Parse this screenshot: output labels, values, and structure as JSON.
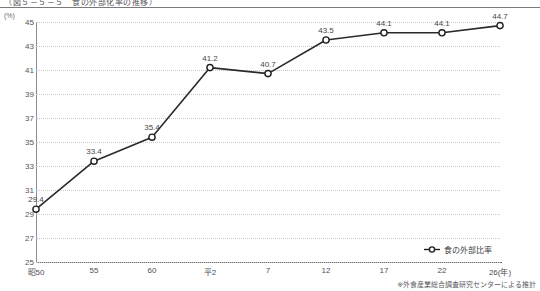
{
  "figure": {
    "title": "（図５－５－５　食の外部化率の推移）",
    "unit_label": "(%)",
    "footnote": "※外食産業総合調査研究センターによる推計"
  },
  "legend": {
    "marker_icon": "open-circle-marker",
    "label": "食の外部比率",
    "position": "bottom-right"
  },
  "chart_data": {
    "type": "line",
    "title": "（図５－５－５　食の外部化率の推移）",
    "xlabel": "(年)",
    "ylabel": "(%)",
    "ylim": [
      25,
      45
    ],
    "ytick_step": 2,
    "grid": true,
    "categories": [
      "昭50",
      "55",
      "60",
      "平2",
      "7",
      "12",
      "17",
      "22",
      "26(年)"
    ],
    "values": [
      29.4,
      33.4,
      35.4,
      41.2,
      40.7,
      43.5,
      44.1,
      44.1,
      44.7
    ],
    "point_labels": [
      "29.4",
      "33.4",
      "35.4",
      "41.2",
      "40.7",
      "43.5",
      "44.1",
      "44.1",
      "44.7"
    ],
    "ytick_labels": [
      "45",
      "43",
      "41",
      "39",
      "37",
      "35",
      "33",
      "31",
      "29",
      "27",
      "25"
    ],
    "series": [
      {
        "name": "食の外部比率",
        "values": [
          29.4,
          33.4,
          35.4,
          41.2,
          40.7,
          43.5,
          44.1,
          44.1,
          44.7
        ],
        "color": "#2a2a2a",
        "marker": "open-circle"
      }
    ],
    "annotations": [
      "※外食産業総合調査研究センターによる推計"
    ]
  }
}
